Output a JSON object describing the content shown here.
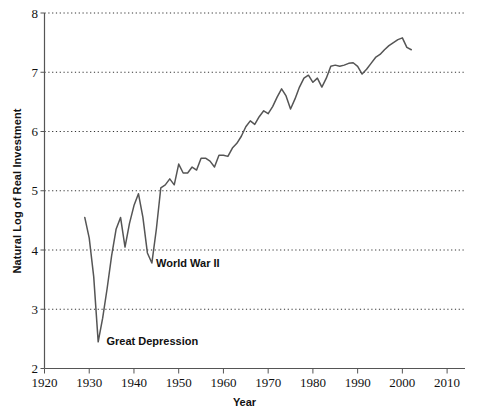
{
  "chart_data": {
    "type": "line",
    "title": "",
    "xlabel": "Year",
    "ylabel": "Natural Log of Real Investment",
    "xlim": [
      1920,
      2014
    ],
    "ylim": [
      2,
      8
    ],
    "grid": true,
    "legend": false,
    "series_name": "Natural Log of Real Investment",
    "line_color": "#555555",
    "x_ticks": [
      1920,
      1930,
      1940,
      1950,
      1960,
      1970,
      1980,
      1990,
      2000,
      2010
    ],
    "y_ticks": [
      2,
      3,
      4,
      5,
      6,
      7,
      8
    ],
    "x": [
      1929,
      1930,
      1931,
      1932,
      1933,
      1934,
      1935,
      1936,
      1937,
      1938,
      1939,
      1940,
      1941,
      1942,
      1943,
      1944,
      1945,
      1946,
      1947,
      1948,
      1949,
      1950,
      1951,
      1952,
      1953,
      1954,
      1955,
      1956,
      1957,
      1958,
      1959,
      1960,
      1961,
      1962,
      1963,
      1964,
      1965,
      1966,
      1967,
      1968,
      1969,
      1970,
      1971,
      1972,
      1973,
      1974,
      1975,
      1976,
      1977,
      1978,
      1979,
      1980,
      1981,
      1982,
      1983,
      1984,
      1985,
      1986,
      1987,
      1988,
      1989,
      1990,
      1991,
      1992,
      1993,
      1994,
      1995,
      1996,
      1997,
      1998,
      1999,
      2000,
      2001,
      2002
    ],
    "y": [
      4.55,
      4.2,
      3.55,
      2.45,
      2.85,
      3.35,
      3.9,
      4.35,
      4.55,
      4.05,
      4.45,
      4.75,
      4.95,
      4.55,
      3.95,
      3.78,
      4.35,
      5.05,
      5.1,
      5.2,
      5.1,
      5.45,
      5.3,
      5.3,
      5.4,
      5.35,
      5.55,
      5.55,
      5.5,
      5.4,
      5.6,
      5.6,
      5.58,
      5.72,
      5.8,
      5.92,
      6.08,
      6.18,
      6.12,
      6.25,
      6.35,
      6.3,
      6.42,
      6.58,
      6.72,
      6.6,
      6.38,
      6.55,
      6.75,
      6.9,
      6.95,
      6.83,
      6.9,
      6.75,
      6.9,
      7.1,
      7.12,
      7.1,
      7.12,
      7.15,
      7.16,
      7.1,
      6.97,
      7.05,
      7.15,
      7.25,
      7.3,
      7.38,
      7.45,
      7.5,
      7.55,
      7.58,
      7.42,
      7.38
    ],
    "annotations": [
      {
        "label": "Great Depression",
        "x": 1933.4,
        "y": 2.46
      },
      {
        "label": "World War II",
        "x": 1944.5,
        "y": 3.78
      }
    ]
  }
}
